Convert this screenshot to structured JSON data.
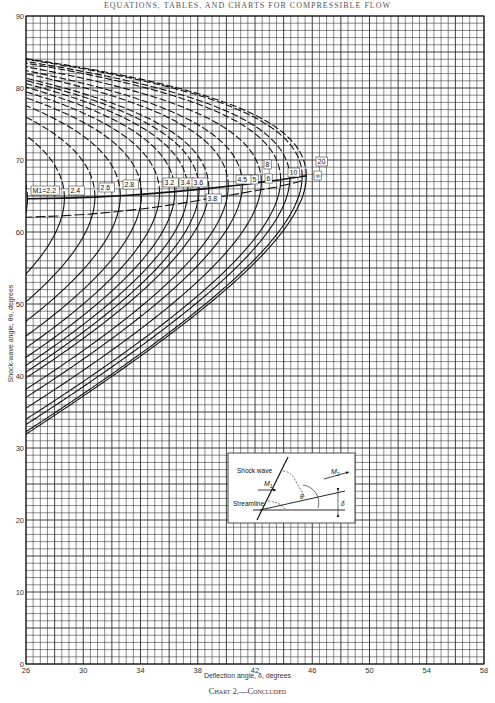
{
  "page": {
    "header": "EQUATIONS, TABLES, AND CHARTS FOR COMPRESSIBLE FLOW",
    "caption": "Chart 2.—Concluded"
  },
  "chart_data": {
    "type": "line",
    "xlabel": "Deflection angle, δ, degrees",
    "ylabel": "Shock-wave angle, θs, degrees",
    "xlim": [
      26,
      58
    ],
    "ylim": [
      0,
      90
    ],
    "xticks": [
      26,
      30,
      34,
      38,
      42,
      46,
      50,
      54,
      58
    ],
    "yticks": [
      0,
      10,
      20,
      30,
      40,
      50,
      60,
      70,
      80,
      90
    ],
    "grid": true,
    "grid_minor_x": 0.5,
    "grid_minor_y": 1,
    "legend": "curve labels inline (M1 values)",
    "series_param": "M1",
    "mach_values": [
      2.2,
      2.4,
      2.6,
      2.8,
      3.0,
      3.2,
      3.4,
      3.6,
      3.8,
      4.0,
      4.5,
      5,
      6,
      8,
      10,
      20,
      "∞"
    ],
    "mach_labels": [
      "M1=2.2",
      "2.4",
      "2.6",
      "2.8",
      "3.0",
      "3.2",
      "3.4",
      "3.6",
      "3.8",
      "4.0",
      "4.5",
      "5",
      "6",
      "8",
      "10",
      "20",
      "∞"
    ],
    "weak_branch": "solid lines (lower θs)",
    "strong_branch": "dashed lines (upper θs)",
    "max_deflection_points": [
      {
        "M": 2.2,
        "delta_max": 26.1,
        "theta": 64.7
      },
      {
        "M": 2.4,
        "delta_max": 28.7,
        "theta": 65.2
      },
      {
        "M": 2.6,
        "delta_max": 30.9,
        "theta": 65.5
      },
      {
        "M": 2.8,
        "delta_max": 32.8,
        "theta": 65.8
      },
      {
        "M": 3.0,
        "delta_max": 34.1,
        "theta": 65.9
      },
      {
        "M": 3.2,
        "delta_max": 35.4,
        "theta": 66.0
      },
      {
        "M": 3.4,
        "delta_max": 36.5,
        "theta": 66.1
      },
      {
        "M": 3.6,
        "delta_max": 37.4,
        "theta": 66.2
      },
      {
        "M": 3.8,
        "delta_max": 38.2,
        "theta": 66.3
      },
      {
        "M": 4.0,
        "delta_max": 38.8,
        "theta": 66.4
      },
      {
        "M": 4.5,
        "delta_max": 40.1,
        "theta": 66.6
      },
      {
        "M": 5,
        "delta_max": 41.1,
        "theta": 66.7
      },
      {
        "M": 6,
        "delta_max": 42.4,
        "theta": 66.9
      },
      {
        "M": 8,
        "delta_max": 43.8,
        "theta": 67.1
      },
      {
        "M": 10,
        "delta_max": 44.4,
        "theta": 67.3
      },
      {
        "M": 20,
        "delta_max": 45.2,
        "theta": 67.5
      },
      {
        "M": "∞",
        "delta_max": 45.6,
        "theta": 67.8
      }
    ],
    "annotations": [
      "locus of maximum deflection",
      "sonic line (M2 = 1)"
    ]
  },
  "inset": {
    "shock_label": "Shock wave",
    "streamline_label": "Streamline",
    "m1_label": "M",
    "m1_sub": "1",
    "m2_label": "M",
    "m2_sub": "2",
    "theta_label": "θ",
    "delta_label": "δ"
  }
}
